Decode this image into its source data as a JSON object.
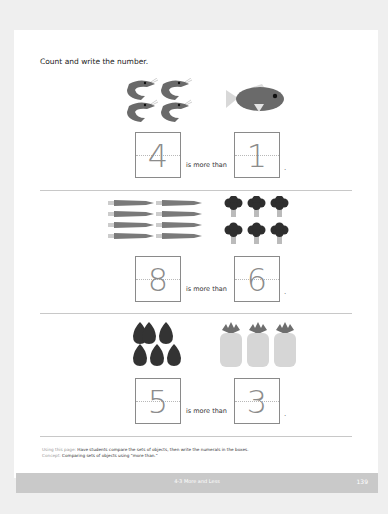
{
  "instruction": "Count and write the number.",
  "problems": [
    {
      "left_object": "shrimp",
      "left_count": 4,
      "left_answer": "4",
      "phrase": "is more than",
      "right_object": "fish",
      "right_count": 1,
      "right_answer": "1",
      "end": "."
    },
    {
      "left_object": "carrot",
      "left_count": 8,
      "left_answer": "8",
      "phrase": "is more than",
      "right_object": "broccoli",
      "right_count": 6,
      "right_answer": "6",
      "end": "."
    },
    {
      "left_object": "avocado",
      "left_count": 5,
      "left_answer": "5",
      "phrase": "is more than",
      "right_object": "pineapple",
      "right_count": 3,
      "right_answer": "3",
      "end": "."
    }
  ],
  "footnote": {
    "using_label": "Using this page:",
    "using_text": "Have students compare the sets of objects, then write the numerals in the boxes.",
    "concept_label": "Concept:",
    "concept_text": "Comparing sets of objects using \"more than.\""
  },
  "footer": {
    "title": "4-3 More and Less",
    "page_number": "139"
  },
  "colors": {
    "page": "#ffffff",
    "background": "#efefef",
    "footer_bar": "#c9c9c9",
    "icon_dark": "#555555",
    "icon_light": "#d0d0d0"
  }
}
